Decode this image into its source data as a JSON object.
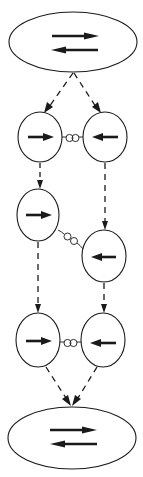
{
  "diagram": {
    "colors": {
      "stroke": "#1a1a1a",
      "background": "#ffffff"
    },
    "nodes": [
      {
        "id": "top-ellipse",
        "type": "ellipse",
        "cx": 73,
        "cy": 42,
        "rx": 64,
        "ry": 30,
        "content": "opposing-arrows"
      },
      {
        "id": "row1-left",
        "type": "circle",
        "cx": 40,
        "cy": 137,
        "rx": 22,
        "ry": 25,
        "arrow": "right"
      },
      {
        "id": "row1-right",
        "type": "circle",
        "cx": 105,
        "cy": 137,
        "rx": 22,
        "ry": 25,
        "arrow": "left"
      },
      {
        "id": "row2-left",
        "type": "circle",
        "cx": 38,
        "cy": 215,
        "rx": 21,
        "ry": 26,
        "arrow": "right"
      },
      {
        "id": "row2-right",
        "type": "circle",
        "cx": 104,
        "cy": 256,
        "rx": 22,
        "ry": 26,
        "arrow": "left"
      },
      {
        "id": "row3-left",
        "type": "circle",
        "cx": 38,
        "cy": 340,
        "rx": 22,
        "ry": 27,
        "arrow": "right"
      },
      {
        "id": "row3-right",
        "type": "circle",
        "cx": 103,
        "cy": 340,
        "rx": 22,
        "ry": 27,
        "arrow": "left"
      },
      {
        "id": "bottom-ellipse",
        "type": "ellipse",
        "cx": 72,
        "cy": 438,
        "rx": 64,
        "ry": 31,
        "content": "opposing-arrows"
      }
    ],
    "springs": [
      {
        "id": "spring-row1",
        "from": "row1-left",
        "to": "row1-right"
      },
      {
        "id": "spring-row2",
        "from": "row2-left",
        "to": "row2-right"
      },
      {
        "id": "spring-row3",
        "from": "row3-left",
        "to": "row3-right"
      }
    ],
    "dashed_arrows": [
      {
        "from": "top-ellipse",
        "to": "row1-left"
      },
      {
        "from": "top-ellipse",
        "to": "row1-right"
      },
      {
        "from": "row1-left",
        "to": "row2-left"
      },
      {
        "from": "row1-right",
        "to": "row2-right"
      },
      {
        "from": "row2-left",
        "to": "row3-left"
      },
      {
        "from": "row2-right",
        "to": "row3-right"
      },
      {
        "from": "row3-left",
        "to": "bottom-ellipse"
      },
      {
        "from": "row3-right",
        "to": "bottom-ellipse"
      }
    ]
  }
}
